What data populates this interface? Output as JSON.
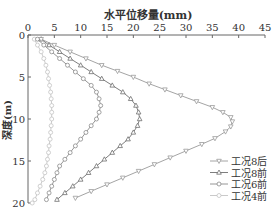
{
  "chart_data": {
    "type": "line",
    "title": "",
    "xlabel": "水平位移量(mm)",
    "ylabel": "深度(m)",
    "xlim": [
      0,
      45
    ],
    "ylim": [
      20,
      0
    ],
    "x_ticks": [
      0,
      5,
      10,
      15,
      20,
      25,
      30,
      35,
      40,
      45
    ],
    "y_ticks": [
      0,
      5,
      10,
      15,
      20
    ],
    "x_axis_position": "top",
    "y_inverted": true,
    "grid": false,
    "legend_position": "lower right",
    "series": [
      {
        "name": "工况8后",
        "marker": "triangle-down",
        "color": "#9a9a9a",
        "points": [
          [
            2.5,
            0.5
          ],
          [
            5,
            1.2
          ],
          [
            8,
            2
          ],
          [
            11,
            2.8
          ],
          [
            14,
            3.6
          ],
          [
            17,
            4.3
          ],
          [
            20,
            5
          ],
          [
            23,
            5.8
          ],
          [
            26,
            6.5
          ],
          [
            29,
            7.2
          ],
          [
            32,
            7.9
          ],
          [
            35,
            8.6
          ],
          [
            37,
            9.2
          ],
          [
            38.5,
            9.8
          ],
          [
            38.8,
            10.3
          ],
          [
            38.5,
            10.9
          ],
          [
            37.5,
            11.5
          ],
          [
            35.5,
            12.3
          ],
          [
            33,
            13
          ],
          [
            30,
            13.8
          ],
          [
            27,
            14.6
          ],
          [
            24,
            15.4
          ],
          [
            21,
            16.2
          ],
          [
            18,
            17
          ],
          [
            15,
            17.8
          ],
          [
            12,
            18.6
          ],
          [
            9,
            19.4
          ]
        ]
      },
      {
        "name": "工况8前",
        "marker": "triangle-up",
        "color": "#6f6f6f",
        "points": [
          [
            2.5,
            0.5
          ],
          [
            4,
            1.2
          ],
          [
            6,
            2
          ],
          [
            8,
            2.8
          ],
          [
            10,
            3.6
          ],
          [
            12,
            4.4
          ],
          [
            14,
            5.2
          ],
          [
            16,
            6
          ],
          [
            18,
            6.8
          ],
          [
            19.5,
            7.6
          ],
          [
            20.5,
            8.4
          ],
          [
            21,
            9.2
          ],
          [
            21.2,
            10
          ],
          [
            20.8,
            10.8
          ],
          [
            20,
            11.6
          ],
          [
            19,
            12.4
          ],
          [
            17.5,
            13.2
          ],
          [
            16,
            14
          ],
          [
            14.5,
            14.8
          ],
          [
            13,
            15.6
          ],
          [
            11.5,
            16.4
          ],
          [
            10,
            17.2
          ],
          [
            8.5,
            18
          ],
          [
            7,
            18.8
          ],
          [
            5.5,
            19.6
          ]
        ]
      },
      {
        "name": "工况6前",
        "marker": "circle",
        "color": "#8a8a8a",
        "points": [
          [
            1.8,
            0.5
          ],
          [
            3,
            1.2
          ],
          [
            4.5,
            2
          ],
          [
            6,
            2.8
          ],
          [
            7.5,
            3.6
          ],
          [
            9,
            4.4
          ],
          [
            10.5,
            5.2
          ],
          [
            12,
            6
          ],
          [
            13,
            6.8
          ],
          [
            13.5,
            7.6
          ],
          [
            13.8,
            8.4
          ],
          [
            13.5,
            9.2
          ],
          [
            13,
            10
          ],
          [
            12,
            10.8
          ],
          [
            11,
            11.6
          ],
          [
            10,
            12.4
          ],
          [
            9,
            13.2
          ],
          [
            8,
            14
          ],
          [
            7,
            14.8
          ],
          [
            6,
            15.6
          ],
          [
            5.5,
            16.4
          ],
          [
            5,
            17.2
          ],
          [
            4.5,
            18
          ],
          [
            4,
            18.8
          ],
          [
            3.5,
            19.6
          ]
        ]
      },
      {
        "name": "工况4前",
        "marker": "circle",
        "color": "#c4c4c4",
        "points": [
          [
            1.2,
            0.5
          ],
          [
            1.8,
            1.2
          ],
          [
            2.5,
            2
          ],
          [
            3,
            2.8
          ],
          [
            3.4,
            3.6
          ],
          [
            3.7,
            4.4
          ],
          [
            3.9,
            5.2
          ],
          [
            4.1,
            6
          ],
          [
            4.3,
            6.8
          ],
          [
            4.4,
            7.6
          ],
          [
            4.5,
            8.4
          ],
          [
            4.5,
            9.2
          ],
          [
            4.5,
            10
          ],
          [
            4.4,
            10.8
          ],
          [
            4.3,
            11.6
          ],
          [
            4.2,
            12.4
          ],
          [
            4,
            13.2
          ],
          [
            3.9,
            14
          ],
          [
            3.7,
            14.8
          ],
          [
            3.5,
            15.6
          ],
          [
            3.2,
            16.4
          ],
          [
            2.8,
            17.2
          ],
          [
            2.3,
            18
          ],
          [
            1.8,
            18.8
          ],
          [
            1.3,
            19.6
          ],
          [
            0.8,
            20
          ]
        ]
      }
    ]
  }
}
